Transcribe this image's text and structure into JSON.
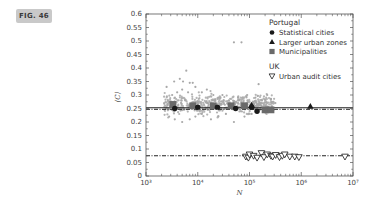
{
  "figure": {
    "badge": "FIG. 46"
  },
  "chart_data": {
    "type": "scatter",
    "title": "",
    "xlabel": "N",
    "ylabel": "⟨C⟩",
    "xscale": "log",
    "xlim": [
      1000,
      10000000
    ],
    "ylim": [
      0,
      0.6
    ],
    "x_ticks": [
      "10³",
      "10⁴",
      "10⁵",
      "10⁶",
      "10⁷"
    ],
    "y_ticks": [
      "0",
      "0.05",
      "0.1",
      "0.15",
      "0.2",
      "0.25",
      "0.3",
      "0.35",
      "0.4",
      "0.45",
      "0.5",
      "0.55",
      "0.6"
    ],
    "grid": false,
    "legend": {
      "position": "upper right",
      "groups": [
        {
          "heading": "Portugal",
          "entries": [
            {
              "label": "Statistical cities",
              "marker": "filled-circle"
            },
            {
              "label": "Larger urban zones",
              "marker": "filled-triangle-up"
            },
            {
              "label": "Municipalities",
              "marker": "filled-square"
            }
          ]
        },
        {
          "heading": "UK",
          "entries": [
            {
              "label": "Urban audit cities",
              "marker": "open-triangle-down"
            }
          ]
        }
      ]
    },
    "reference_lines": [
      {
        "name": "Portugal mean",
        "y": 0.25,
        "style": "solid+dash-dot"
      },
      {
        "name": "UK mean",
        "y": 0.075,
        "style": "dash-dot"
      }
    ],
    "series": [
      {
        "name": "Background cloud (light grey)",
        "marker": "small-dot",
        "color": "#a8a8a8",
        "description": "Dense cloud of points for N in approx 10^3.3 to 10^5.5, <C> between approx 0.19 and 0.39, with two outliers near 0.49 at N approx 10^4.7",
        "points": [
          [
            2500,
            0.33
          ],
          [
            3500,
            0.35
          ],
          [
            6000,
            0.39
          ],
          [
            4500,
            0.36
          ],
          [
            5200,
            0.35
          ],
          [
            7000,
            0.345
          ],
          [
            8000,
            0.345
          ],
          [
            5000,
            0.32
          ],
          [
            4000,
            0.31
          ],
          [
            3200,
            0.3
          ],
          [
            6500,
            0.31
          ],
          [
            9000,
            0.33
          ],
          [
            12000,
            0.31
          ],
          [
            15000,
            0.32
          ],
          [
            20000,
            0.3
          ],
          [
            25000,
            0.29
          ],
          [
            30000,
            0.3
          ],
          [
            40000,
            0.28
          ],
          [
            60000,
            0.29
          ],
          [
            90000,
            0.3
          ],
          [
            130000,
            0.29
          ],
          [
            2800,
            0.22
          ],
          [
            3600,
            0.21
          ],
          [
            5000,
            0.2
          ],
          [
            7000,
            0.21
          ],
          [
            9000,
            0.22
          ],
          [
            12000,
            0.23
          ],
          [
            18000,
            0.21
          ],
          [
            25000,
            0.22
          ],
          [
            35000,
            0.23
          ],
          [
            50000,
            0.2
          ],
          [
            80000,
            0.22
          ],
          [
            110000,
            0.23
          ],
          [
            50000,
            0.495
          ],
          [
            70000,
            0.495
          ],
          [
            150000,
            0.34
          ],
          [
            220000,
            0.3
          ]
        ]
      },
      {
        "name": "Statistical cities",
        "marker": "filled-circle",
        "color": "#1a1a1a",
        "points": [
          [
            3600,
            0.25
          ],
          [
            10000,
            0.255
          ],
          [
            24000,
            0.255
          ],
          [
            54000,
            0.25
          ],
          [
            110000,
            0.255
          ],
          [
            140000,
            0.24
          ]
        ]
      },
      {
        "name": "Larger urban zones",
        "marker": "filled-triangle-up",
        "color": "#1a1a1a",
        "points": [
          [
            110000,
            0.262
          ],
          [
            1500000,
            0.258
          ]
        ]
      },
      {
        "name": "Municipalities",
        "marker": "filled-square",
        "color": "#6a6a6a",
        "points": [
          [
            3300,
            0.265
          ],
          [
            8000,
            0.26
          ],
          [
            20000,
            0.26
          ],
          [
            44000,
            0.26
          ],
          [
            80000,
            0.26
          ],
          [
            200000,
            0.245
          ],
          [
            260000,
            0.245
          ]
        ]
      },
      {
        "name": "Urban audit cities",
        "marker": "open-triangle-down",
        "color": "#1a1a1a",
        "points": [
          [
            85000,
            0.072
          ],
          [
            95000,
            0.068
          ],
          [
            100000,
            0.08
          ],
          [
            120000,
            0.075
          ],
          [
            140000,
            0.068
          ],
          [
            170000,
            0.085
          ],
          [
            190000,
            0.07
          ],
          [
            220000,
            0.08
          ],
          [
            260000,
            0.075
          ],
          [
            280000,
            0.072
          ],
          [
            320000,
            0.078
          ],
          [
            380000,
            0.07
          ],
          [
            430000,
            0.075
          ],
          [
            480000,
            0.08
          ],
          [
            600000,
            0.072
          ],
          [
            750000,
            0.072
          ],
          [
            900000,
            0.07
          ],
          [
            7000000,
            0.072
          ]
        ]
      }
    ]
  }
}
